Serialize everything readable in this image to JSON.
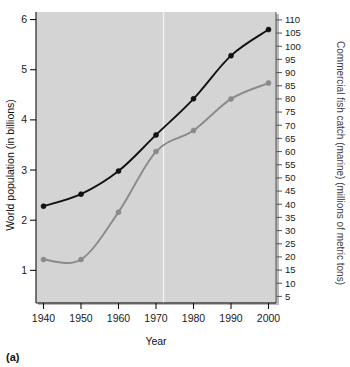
{
  "figure": {
    "panel_label": "(a)",
    "background_color": "#ffffff",
    "plot_background_color": "#d4d4d4"
  },
  "chart_data": {
    "type": "line",
    "title": "",
    "xlabel": "Year",
    "ylabel": "World population (in billions)",
    "y2label": "Commercial fish catch (marine) (millions of metric tons)",
    "x": [
      1940,
      1950,
      1960,
      1970,
      1980,
      1990,
      2000
    ],
    "xlim": [
      1938,
      2002
    ],
    "xticks": [
      1940,
      1950,
      1960,
      1970,
      1980,
      1990,
      2000
    ],
    "xticklabels": [
      "1940",
      "1950",
      "1960",
      "1970",
      "1980",
      "1990",
      "2000"
    ],
    "ylim": [
      0.35,
      6.15
    ],
    "yticks": [
      1,
      2,
      3,
      4,
      5,
      6
    ],
    "yticklabels": [
      "1",
      "2",
      "3",
      "4",
      "5",
      "6"
    ],
    "y2lim": [
      2.5,
      113
    ],
    "y2ticks": [
      5,
      10,
      15,
      20,
      25,
      30,
      35,
      40,
      45,
      50,
      55,
      60,
      65,
      70,
      75,
      80,
      85,
      90,
      95,
      100,
      105,
      110
    ],
    "y2ticklabels": [
      "5",
      "10",
      "15",
      "20",
      "25",
      "30",
      "35",
      "40",
      "45",
      "50",
      "55",
      "60",
      "65",
      "70",
      "75",
      "80",
      "85",
      "90",
      "95",
      "100",
      "105",
      "110"
    ],
    "grid": false,
    "legend_position": "none",
    "annotations": [
      {
        "type": "vertical-line",
        "name": "marker-line-1972",
        "x": 1972,
        "color": "#f2f2f2"
      }
    ],
    "series": [
      {
        "name": "World population",
        "axis": "left",
        "color": "#111111",
        "marker": "circle",
        "values": [
          2.28,
          2.52,
          2.98,
          3.7,
          4.42,
          5.28,
          5.8
        ]
      },
      {
        "name": "Commercial fish catch (marine)",
        "axis": "right",
        "color": "#8a8a8a",
        "marker": "circle",
        "values": [
          19,
          19,
          37,
          60,
          68,
          80,
          86
        ]
      }
    ]
  }
}
